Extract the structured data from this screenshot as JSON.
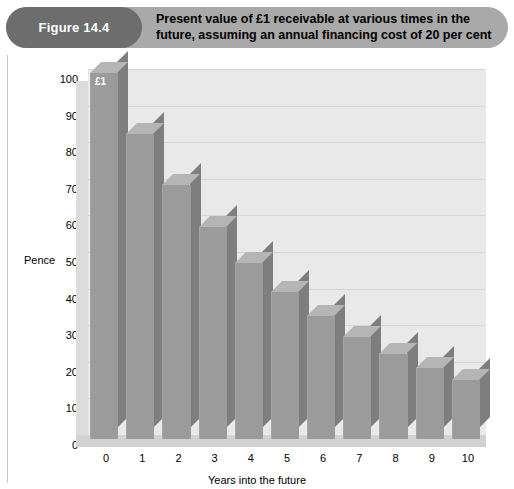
{
  "header": {
    "figure_number": "Figure 14.4",
    "title": "Present value of £1 receivable at various times in the future, assuming an annual financing cost of 20 per cent"
  },
  "chart_data": {
    "type": "bar",
    "title": "Present value of £1 receivable at various times in the future, assuming an annual financing cost of 20 per cent",
    "xlabel": "Years into the future",
    "ylabel": "Pence",
    "categories": [
      "0",
      "1",
      "2",
      "3",
      "4",
      "5",
      "6",
      "7",
      "8",
      "9",
      "10"
    ],
    "values": [
      100,
      83.3,
      69.4,
      57.9,
      48.2,
      40.2,
      33.5,
      27.9,
      23.3,
      19.4,
      16.2
    ],
    "ylim": [
      0,
      100
    ],
    "yticks": [
      "0",
      "10",
      "20",
      "30",
      "40",
      "50",
      "60",
      "70",
      "80",
      "90",
      "100"
    ],
    "grid": true,
    "legend": "none",
    "annotations": [
      {
        "series_index": 0,
        "text": "£1"
      }
    ],
    "colors": {
      "bar_front": "#9b9b9b",
      "bar_side": "#7e7e7e",
      "bar_top": "#b5b5b5",
      "plot_background": "#e9e9e9",
      "header_bar": "#a9a9a9",
      "header_pill": "#6d6d6d"
    }
  }
}
